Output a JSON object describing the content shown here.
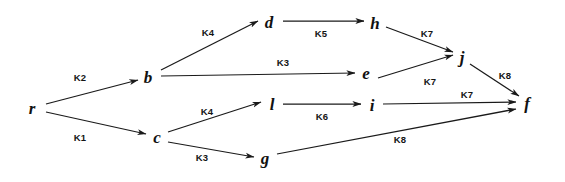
{
  "diagram": {
    "type": "directed-graph",
    "width": 565,
    "height": 182,
    "background_color": "#ffffff",
    "stroke_color": "#1a1a1a",
    "text_color": "#111111",
    "nodes": [
      {
        "id": "r",
        "label": "r",
        "x": 32,
        "y": 108
      },
      {
        "id": "b",
        "label": "b",
        "x": 148,
        "y": 77
      },
      {
        "id": "c",
        "label": "c",
        "x": 157,
        "y": 137
      },
      {
        "id": "d",
        "label": "d",
        "x": 269,
        "y": 22
      },
      {
        "id": "h",
        "label": "h",
        "x": 375,
        "y": 23
      },
      {
        "id": "e",
        "label": "e",
        "x": 366,
        "y": 73
      },
      {
        "id": "j",
        "label": "j",
        "x": 462,
        "y": 57
      },
      {
        "id": "l",
        "label": "l",
        "x": 272,
        "y": 104
      },
      {
        "id": "i",
        "label": "i",
        "x": 372,
        "y": 105
      },
      {
        "id": "g",
        "label": "g",
        "x": 265,
        "y": 158
      },
      {
        "id": "f",
        "label": "f",
        "x": 527,
        "y": 103
      }
    ],
    "edges": [
      {
        "from": "r",
        "to": "b",
        "label": "K2",
        "x1": 46,
        "y1": 104,
        "x2": 138,
        "y2": 80,
        "lx": 80,
        "ly": 78
      },
      {
        "from": "r",
        "to": "c",
        "label": "K1",
        "x1": 46,
        "y1": 112,
        "x2": 146,
        "y2": 134,
        "lx": 80,
        "ly": 138
      },
      {
        "from": "b",
        "to": "d",
        "label": "K4",
        "x1": 161,
        "y1": 70,
        "x2": 258,
        "y2": 21,
        "lx": 208,
        "ly": 33
      },
      {
        "from": "b",
        "to": "e",
        "label": "K3",
        "x1": 161,
        "y1": 76,
        "x2": 355,
        "y2": 73,
        "lx": 283,
        "ly": 63
      },
      {
        "from": "d",
        "to": "h",
        "label": "K5",
        "x1": 283,
        "y1": 21,
        "x2": 364,
        "y2": 21,
        "lx": 321,
        "ly": 34
      },
      {
        "from": "h",
        "to": "j",
        "label": "K7",
        "x1": 386,
        "y1": 27,
        "x2": 453,
        "y2": 52,
        "lx": 427,
        "ly": 34
      },
      {
        "from": "e",
        "to": "j",
        "label": "K7",
        "x1": 378,
        "y1": 78,
        "x2": 453,
        "y2": 55,
        "lx": 430,
        "ly": 82
      },
      {
        "from": "j",
        "to": "f",
        "label": "K8",
        "x1": 470,
        "y1": 64,
        "x2": 519,
        "y2": 96,
        "lx": 505,
        "ly": 76
      },
      {
        "from": "c",
        "to": "l",
        "label": "K4",
        "x1": 168,
        "y1": 132,
        "x2": 261,
        "y2": 102,
        "lx": 207,
        "ly": 112
      },
      {
        "from": "c",
        "to": "g",
        "label": "K3",
        "x1": 168,
        "y1": 142,
        "x2": 254,
        "y2": 157,
        "lx": 202,
        "ly": 158
      },
      {
        "from": "l",
        "to": "i",
        "label": "K6",
        "x1": 283,
        "y1": 104,
        "x2": 361,
        "y2": 104,
        "lx": 322,
        "ly": 117
      },
      {
        "from": "i",
        "to": "f",
        "label": "K7",
        "x1": 383,
        "y1": 104,
        "x2": 516,
        "y2": 102,
        "lx": 467,
        "ly": 95
      },
      {
        "from": "g",
        "to": "f",
        "label": "K8",
        "x1": 277,
        "y1": 154,
        "x2": 516,
        "y2": 109,
        "lx": 400,
        "ly": 140
      }
    ]
  }
}
